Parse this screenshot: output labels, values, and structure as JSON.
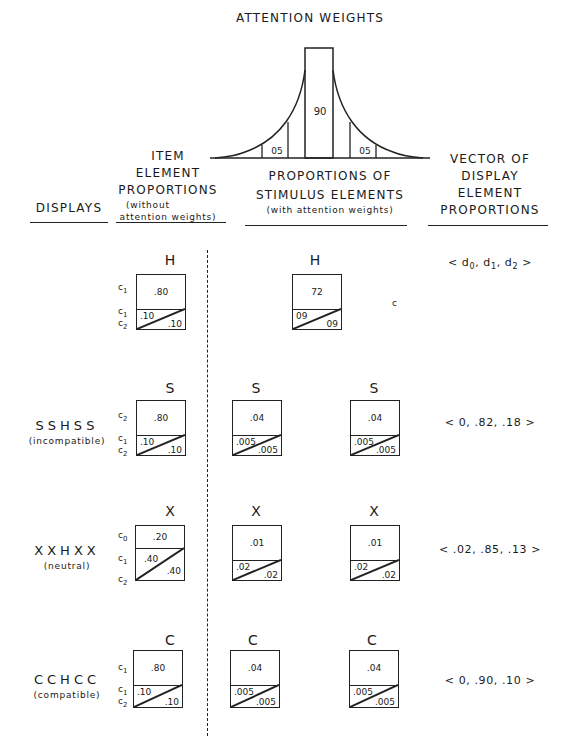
{
  "attention": {
    "title": "ATTENTION WEIGHTS",
    "center_weight": "90",
    "left_weight": "05",
    "right_weight": "05"
  },
  "headers": {
    "displays": "DISPLAYS",
    "item": {
      "line1": "ITEM",
      "line2": "ELEMENT",
      "line3": "PROPORTIONS",
      "sub1": "(without",
      "sub2": "attention weights)"
    },
    "stimulus": {
      "line1": "PROPORTIONS OF",
      "line2": "STIMULUS ELEMENTS",
      "sub": "(with attention weights)"
    },
    "vector": {
      "line1": "VECTOR OF",
      "line2": "DISPLAY",
      "line3": "ELEMENT",
      "line4": "PROPORTIONS"
    }
  },
  "rows": [
    {
      "display": "",
      "display_sub": "",
      "item": {
        "letter": "H",
        "labels": [
          "c1",
          "c1",
          "c2"
        ],
        "top": ".80",
        "bl": ".10",
        "br": ".10"
      },
      "stimulus": [
        {
          "letter": "H",
          "top": "72",
          "bl": "09",
          "br": "09"
        }
      ],
      "stray_mark": "c",
      "vector": "< d0, d1, d2 >"
    },
    {
      "display": "SSHSS",
      "display_sub": "(incompatible)",
      "item": {
        "letter": "S",
        "labels": [
          "c2",
          "c1",
          "c2"
        ],
        "top": ".80",
        "bl": ".10",
        "br": ".10"
      },
      "stimulus": [
        {
          "letter": "S",
          "top": ".04",
          "bl": ".005",
          "br": ".005"
        },
        {
          "letter": "S",
          "top": ".04",
          "bl": ".005",
          "br": ".005"
        }
      ],
      "vector": "< 0, .82, .18 >"
    },
    {
      "display": "XXHXX",
      "display_sub": "(neutral)",
      "item": {
        "letter": "X",
        "labels": [
          "c0",
          "c1",
          "c2"
        ],
        "top": ".20",
        "bl": ".40",
        "br": ".40"
      },
      "stimulus": [
        {
          "letter": "X",
          "top": ".01",
          "bl": ".02",
          "br": ".02"
        },
        {
          "letter": "X",
          "top": ".01",
          "bl": ".02",
          "br": ".02"
        }
      ],
      "vector": "< .02, .85, .13 >"
    },
    {
      "display": "CCHCC",
      "display_sub": "(compatible)",
      "item": {
        "letter": "C",
        "labels": [
          "c1",
          "c1",
          "c2"
        ],
        "top": ".80",
        "bl": ".10",
        "br": ".10"
      },
      "stimulus": [
        {
          "letter": "C",
          "top": ".04",
          "bl": ".005",
          "br": ".005"
        },
        {
          "letter": "C",
          "top": ".04",
          "bl": ".005",
          "br": ".005"
        }
      ],
      "vector": "< 0, .90, .10 >"
    }
  ]
}
